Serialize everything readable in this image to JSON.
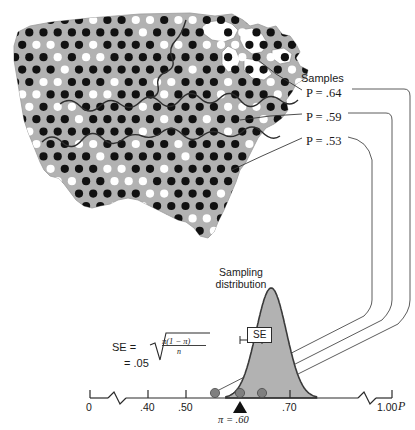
{
  "figure": {
    "samples_header": "Samples",
    "map": {
      "name": "united-states-map",
      "fill_color": "#b2b2b2",
      "dot_black_color": "#111111",
      "dot_white_color": "#ffffff",
      "boundary_color": "#333333",
      "region_count": 3
    },
    "sample_labels": [
      {
        "text": "P  =  .64",
        "value": 0.64
      },
      {
        "text": "P  =  .59",
        "value": 0.59
      },
      {
        "text": "P  =  .53",
        "value": 0.53
      }
    ],
    "distribution_title": "Sampling\ndistribution",
    "distribution_title_line1": "Sampling",
    "distribution_title_line2": "distribution",
    "se_box_label": "SE",
    "se_formula_lhs": "SE  =",
    "se_formula_numerator": "π(1  −  π)",
    "se_formula_denominator": "n",
    "se_value": "=  .05",
    "pi_marker_label": "π  =  .60",
    "axis_variable_label": "P"
  },
  "chart_data": {
    "type": "area",
    "title": "Sampling distribution",
    "xlabel": "P",
    "ylabel": "",
    "xlim": [
      0,
      1.0
    ],
    "tick_labels": [
      "0",
      ".40",
      ".50",
      ".70",
      "1.00"
    ],
    "tick_values": [
      0,
      0.4,
      0.5,
      0.7,
      1.0
    ],
    "axis_breaks": [
      {
        "between": [
          0,
          0.4
        ]
      },
      {
        "between": [
          0.7,
          1.0
        ]
      }
    ],
    "grid": false,
    "legend": "none",
    "curve": {
      "name": "normal-sampling-distribution",
      "mean": 0.6,
      "se": 0.05,
      "fill_color": "#b2b2b2",
      "line_color": "#333333",
      "x_start": 0.45,
      "x_end": 0.75
    },
    "annotations": [
      {
        "label": "π = .60",
        "x": 0.6,
        "type": "triangle-marker"
      },
      {
        "label": "SE",
        "type": "box-label",
        "from": 0.6,
        "to": 0.65
      }
    ],
    "sample_points": [
      {
        "label": "P = .53",
        "x": 0.53,
        "y": 0
      },
      {
        "label": "P = .59",
        "x": 0.59,
        "y": 0
      },
      {
        "label": "P = .64",
        "x": 0.64,
        "y": 0
      }
    ]
  }
}
